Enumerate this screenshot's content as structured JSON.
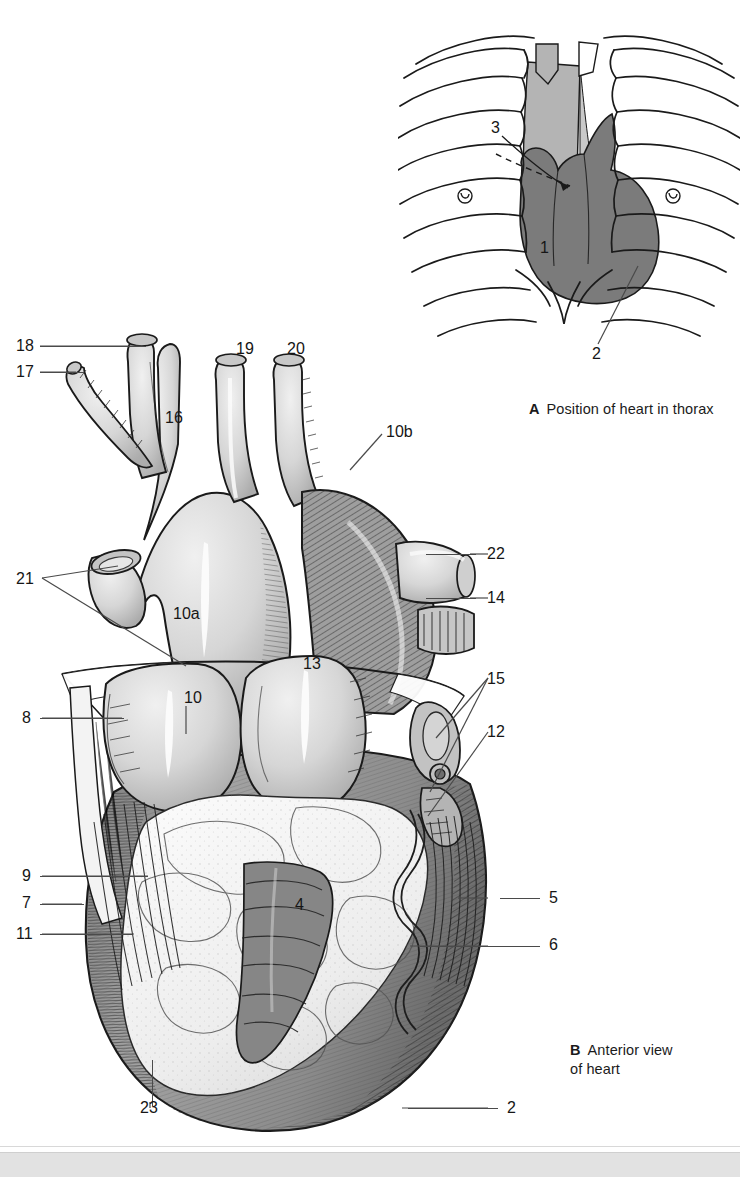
{
  "plate": {
    "background": "#ffffff",
    "ink": "#161616",
    "leader_color": "#4a4a4a"
  },
  "figures": [
    {
      "id": "A",
      "letter": "A",
      "caption": "Position of heart in thorax",
      "type": "line-diagram",
      "description": "Frontal outline of the bony thorax (ribs, sternum, costal cartilages, clavicles) with the cardiac silhouette and mediastinum shaded.",
      "shading": {
        "ribs_fill": "#ffffff",
        "mediastinum_fill": "#b3b3b3",
        "heart_fill": "#7b7b7b",
        "outline": "#1a1a1a"
      },
      "labels": [
        {
          "number": "1",
          "x": 541,
          "y": 241,
          "leader": "none",
          "note": "placed on the cardiac silhouette"
        },
        {
          "number": "2",
          "x": 594,
          "y": 349,
          "leader": "diagonal-up-right",
          "note": "points to the left cardiac border / apex region"
        },
        {
          "number": "3",
          "x": 495,
          "y": 136,
          "leader": "dashed-arrow",
          "note": "dashed arrow pointing into the cardiac shadow"
        }
      ]
    },
    {
      "id": "B",
      "letter": "B",
      "caption": "Anterior view\nof heart",
      "type": "line-diagram",
      "description": "Detailed engraved anterior view of the heart with great vessels, coronary sulcus fat, atrial appendages and cut pericardium.",
      "shading": {
        "vessel_fill": "#d9d9d9",
        "myocardium_fill": "#9a9a9a",
        "fat_fill": "#f4f4f4",
        "outline": "#1a1a1a"
      },
      "labels": [
        {
          "number": "18",
          "x": 16,
          "y": 338,
          "leader": "horizontal-right"
        },
        {
          "number": "17",
          "x": 16,
          "y": 364,
          "leader": "horizontal-right"
        },
        {
          "number": "19",
          "x": 236,
          "y": 341,
          "leader": "none"
        },
        {
          "number": "20",
          "x": 287,
          "y": 341,
          "leader": "none"
        },
        {
          "number": "16",
          "x": 165,
          "y": 410,
          "leader": "none"
        },
        {
          "number": "10b",
          "x": 386,
          "y": 424,
          "leader": "diagonal-down-left"
        },
        {
          "number": "22",
          "x": 487,
          "y": 547,
          "leader": "horizontal-left"
        },
        {
          "number": "14",
          "x": 487,
          "y": 590,
          "leader": "horizontal-left"
        },
        {
          "number": "21",
          "x": 16,
          "y": 571,
          "leader": "forked-right"
        },
        {
          "number": "10a",
          "x": 173,
          "y": 606,
          "leader": "none"
        },
        {
          "number": "13",
          "x": 303,
          "y": 656,
          "leader": "none"
        },
        {
          "number": "15",
          "x": 487,
          "y": 671,
          "leader": "forked-left"
        },
        {
          "number": "10",
          "x": 184,
          "y": 690,
          "leader": "vertical-down"
        },
        {
          "number": "8",
          "x": 20,
          "y": 710,
          "leader": "horizontal-right"
        },
        {
          "number": "12",
          "x": 487,
          "y": 724,
          "leader": "horizontal-left"
        },
        {
          "number": "9",
          "x": 20,
          "y": 868,
          "leader": "horizontal-right"
        },
        {
          "number": "4",
          "x": 295,
          "y": 897,
          "leader": "none"
        },
        {
          "number": "5",
          "x": 549,
          "y": 890,
          "leader": "horizontal-left"
        },
        {
          "number": "7",
          "x": 20,
          "y": 895,
          "leader": "horizontal-right"
        },
        {
          "number": "11",
          "x": 16,
          "y": 926,
          "leader": "horizontal-right"
        },
        {
          "number": "6",
          "x": 549,
          "y": 937,
          "leader": "horizontal-left"
        },
        {
          "number": "23",
          "x": 140,
          "y": 1100,
          "leader": "vertical-up"
        },
        {
          "number": "2",
          "x": 507,
          "y": 1100,
          "leader": "horizontal-left"
        }
      ]
    }
  ],
  "footer": {
    "visible": true,
    "color": "#e2e2e2"
  }
}
